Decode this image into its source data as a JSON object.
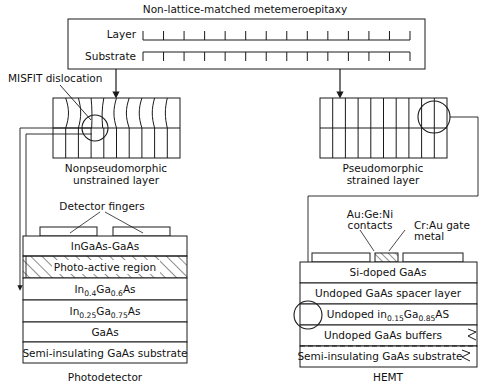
{
  "figure": {
    "title": "Non-lattice-matched metemeroepitaxy",
    "top_box": {
      "title": "Non-lattice-matched metemeroepitaxy",
      "row_layer_label": "Layer",
      "row_substrate_label": "Substrate"
    },
    "left_branch": {
      "annotation": "MISFIT dislocation",
      "caption_line1": "Nonpseudomorphic",
      "caption_line2": "unstrained layer"
    },
    "right_branch": {
      "caption_line1": "Pseudomorphic",
      "caption_line2": "strained layer"
    },
    "photodetector": {
      "caption": "Photodetector",
      "fingers_label": "Detector fingers",
      "layers": [
        "InGaAs-GaAs",
        "Photo-active region",
        "In0.4Ga0.6As",
        "In0.25Ga0.75As",
        "GaAs",
        "Semi-insulating GaAs substrate"
      ],
      "layer_rich": [
        {
          "pre": "In",
          "sub": "0.4",
          "mid": "Ga",
          "sub2": "0.6",
          "post": "As"
        },
        {
          "pre": "In",
          "sub": "0.25",
          "mid": "Ga",
          "sub2": "0.75",
          "post": "As"
        }
      ]
    },
    "hemt": {
      "caption": "HEMT",
      "contacts_label_line1": "Au:Ge:Ni",
      "contacts_label_line2": "contacts",
      "gate_label_line1": "Cr:Au gate",
      "gate_label_line2": "metal",
      "layers": [
        "Si-doped GaAs",
        "Undoped GaAs spacer layer",
        "Undoped in0.15Ga0.85AS",
        "Undoped GaAs buffers",
        "Semi-insulating GaAs substrate"
      ],
      "layer_rich": [
        {
          "pre": "Undoped in",
          "sub": "0.15",
          "mid": "Ga",
          "sub2": "0.85",
          "post": "AS"
        }
      ]
    },
    "colors": {
      "stroke": "#1a1a1a",
      "text": "#111111",
      "background": "#ffffff"
    }
  }
}
